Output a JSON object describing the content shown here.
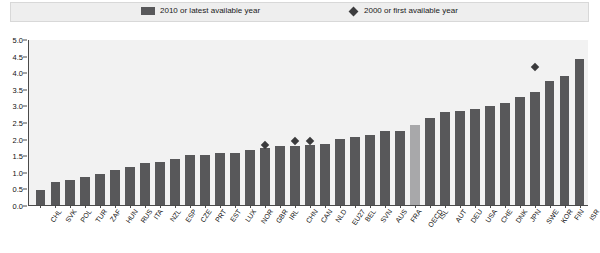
{
  "legend": {
    "series_bar_label": "2010 or latest available year",
    "series_point_label": "2000 or first available year",
    "bar_color": "#58585a",
    "point_color": "#3a3a3c",
    "highlight_color": "#a8a8aa"
  },
  "chart_data": {
    "type": "bar",
    "title": "",
    "xlabel": "",
    "ylabel": "",
    "ylim": [
      0.0,
      5.0
    ],
    "ytick_labels": [
      "0.0",
      "0.5",
      "1.0",
      "1.5",
      "2.0",
      "2.5",
      "3.0",
      "3.5",
      "4.0",
      "4.5",
      "5.0"
    ],
    "ytick_values": [
      0.0,
      0.5,
      1.0,
      1.5,
      2.0,
      2.5,
      3.0,
      3.5,
      4.0,
      4.5,
      5.0
    ],
    "grid": false,
    "legend_position": "top",
    "highlighted_category": "OECD",
    "categories": [
      "CHL",
      "SVK",
      "POL",
      "TUR",
      "ZAF",
      "HUN",
      "RUS",
      "ITA",
      "NZL",
      "ESP",
      "CZE",
      "PRT",
      "EST",
      "LUX",
      "NOR",
      "GBR",
      "IRL",
      "CHN",
      "CAN",
      "NLD",
      "EU27",
      "BEL",
      "SVN",
      "AUS",
      "FRA",
      "OECD",
      "ISL",
      "AUT",
      "DEU",
      "USA",
      "CHE",
      "DNK",
      "JPN",
      "SWE",
      "KOR",
      "FIN",
      "ISR"
    ],
    "series": [
      {
        "name": "2010 or latest available year",
        "type": "bar",
        "values": [
          0.45,
          0.68,
          0.74,
          0.85,
          0.93,
          1.05,
          1.13,
          1.26,
          1.3,
          1.38,
          1.5,
          1.51,
          1.57,
          1.58,
          1.65,
          1.72,
          1.79,
          1.77,
          1.8,
          1.84,
          2.0,
          2.05,
          2.11,
          2.24,
          2.24,
          2.4,
          2.62,
          2.8,
          2.82,
          2.9,
          2.99,
          3.06,
          3.26,
          3.4,
          3.74,
          3.88,
          4.4
        ]
      },
      {
        "name": "2000 or first available year",
        "type": "scatter",
        "points": [
          {
            "category": "GBR",
            "value": 1.82
          },
          {
            "category": "CHN",
            "value": 1.92
          },
          {
            "category": "CAN",
            "value": 1.92
          },
          {
            "category": "SWE",
            "value": 4.15
          }
        ]
      }
    ]
  }
}
